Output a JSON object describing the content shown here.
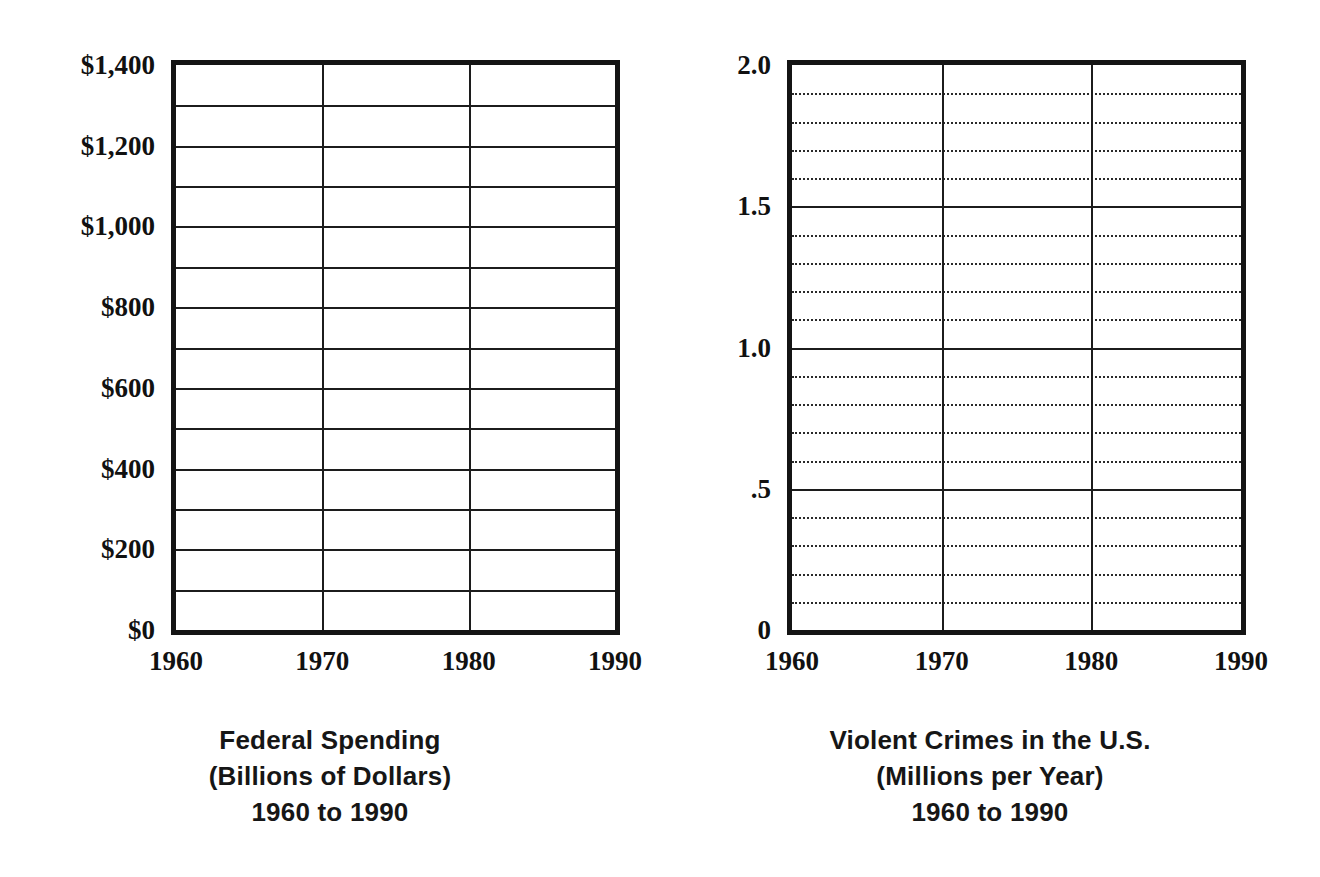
{
  "chart_data": [
    {
      "type": "line",
      "title": "Federal Spending",
      "subtitle": "(Billions of Dollars)",
      "period": "1960 to 1990",
      "caption_lines": [
        "Federal Spending",
        "(Billions of Dollars)",
        "1960 to 1990"
      ],
      "xlabel": "",
      "ylabel": "",
      "x": [
        1960,
        1970,
        1980,
        1990
      ],
      "xticklabels": [
        "1960",
        "1970",
        "1980",
        "1990"
      ],
      "xlim": [
        1960,
        1990
      ],
      "ylim": [
        0,
        1400
      ],
      "yticks": [
        0,
        200,
        400,
        600,
        800,
        1000,
        1200,
        1400
      ],
      "yticklabels": [
        "$0",
        "$200",
        "$400",
        "$600",
        "$800",
        "$1,000",
        "$1,200",
        "$1,400"
      ],
      "y_gridlines_major": [
        0,
        100,
        200,
        300,
        400,
        500,
        600,
        700,
        800,
        900,
        1000,
        1100,
        1200,
        1300,
        1400
      ],
      "y_gridlines_minor": [],
      "x_gridlines": [
        1960,
        1970,
        1980,
        1990
      ],
      "grid": true,
      "legend": null,
      "series": [],
      "values": [],
      "note": "Blank worksheet grid - no data plotted"
    },
    {
      "type": "line",
      "title": "Violent Crimes in the U.S.",
      "subtitle": "(Millions per Year)",
      "period": "1960 to 1990",
      "caption_lines": [
        "Violent Crimes in the U.S.",
        "(Millions per Year)",
        "1960 to 1990"
      ],
      "xlabel": "",
      "ylabel": "",
      "x": [
        1960,
        1970,
        1980,
        1990
      ],
      "xticklabels": [
        "1960",
        "1970",
        "1980",
        "1990"
      ],
      "xlim": [
        1960,
        1990
      ],
      "ylim": [
        0,
        2.0
      ],
      "yticks": [
        0,
        0.5,
        1.0,
        1.5,
        2.0
      ],
      "yticklabels": [
        "0",
        ".5",
        "1.0",
        "1.5",
        "2.0"
      ],
      "y_gridlines_major": [
        0,
        0.5,
        1.0,
        1.5,
        2.0
      ],
      "y_gridlines_minor": [
        0.1,
        0.2,
        0.3,
        0.4,
        0.6,
        0.7,
        0.8,
        0.9,
        1.1,
        1.2,
        1.3,
        1.4,
        1.6,
        1.7,
        1.8,
        1.9
      ],
      "x_gridlines": [
        1960,
        1970,
        1980,
        1990
      ],
      "grid": true,
      "legend": null,
      "series": [],
      "values": [],
      "note": "Blank worksheet grid - no data plotted"
    }
  ],
  "colors": {
    "ink": "#141414",
    "gridline": "#1c1c1c",
    "minor_gridline": "#2a2a2a",
    "background": "#ffffff"
  }
}
